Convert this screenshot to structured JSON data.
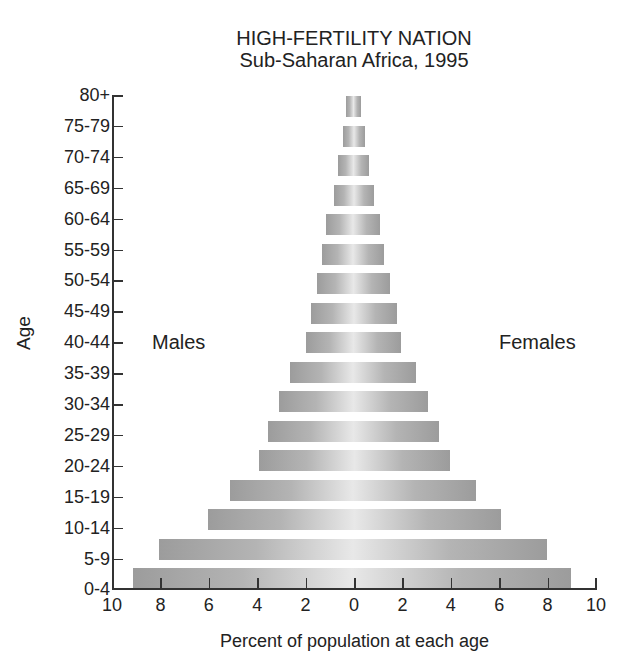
{
  "chart_data": {
    "type": "bar",
    "subtype": "population-pyramid",
    "title": "HIGH-FERTILITY NATION",
    "subtitle": "Sub-Saharan Africa, 1995",
    "xlabel": "Percent of population at each age",
    "ylabel": "Age",
    "xlim": [
      -10,
      10
    ],
    "x_ticks": [
      10,
      8,
      6,
      4,
      2,
      0,
      2,
      4,
      6,
      8,
      10
    ],
    "categories": [
      "80+",
      "75-79",
      "70-74",
      "65-69",
      "60-64",
      "55-59",
      "50-54",
      "45-49",
      "40-44",
      "35-39",
      "30-34",
      "25-29",
      "20-24",
      "15-19",
      "10-14",
      "5-9",
      "0-4"
    ],
    "series": [
      {
        "name": "Males",
        "values": [
          0.3,
          0.4,
          0.6,
          0.8,
          1.1,
          1.3,
          1.5,
          1.75,
          1.95,
          2.6,
          3.05,
          3.5,
          3.9,
          5.1,
          6.0,
          8.0,
          9.1
        ]
      },
      {
        "name": "Females",
        "values": [
          0.35,
          0.5,
          0.65,
          0.85,
          1.1,
          1.3,
          1.55,
          1.8,
          2.0,
          2.6,
          3.1,
          3.55,
          4.0,
          5.1,
          6.1,
          8.0,
          9.0
        ]
      }
    ],
    "legend": {
      "left": "Males",
      "right": "Females",
      "position": "inside"
    },
    "grid": false
  }
}
